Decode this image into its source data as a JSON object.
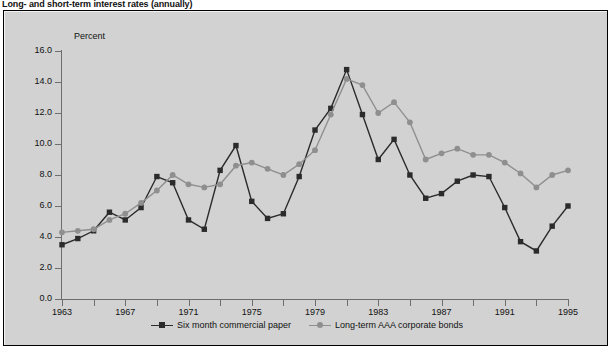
{
  "figure": {
    "title": "Long- and short-term interest rates (annually)",
    "background_color": "#d2d2d2",
    "page_color": "#ffffff",
    "border_color": "#000000"
  },
  "axes": {
    "y_unit_label": "Percent",
    "y_ticks": [
      "0.0",
      "2.0",
      "4.0",
      "6.0",
      "8.0",
      "10.0",
      "12.0",
      "14.0",
      "16.0"
    ],
    "y_min": 0.0,
    "y_max": 16.0,
    "x_ticks": [
      "1963",
      "1967",
      "1971",
      "1975",
      "1979",
      "1983",
      "1987",
      "1991",
      "1995"
    ],
    "x_min": 1963,
    "x_max": 1995,
    "axis_color": "#6e6e6e"
  },
  "legend": {
    "position": "bottom-center",
    "items": [
      {
        "label": "Six month commercial paper",
        "color": "#2b2b2b",
        "marker": "square"
      },
      {
        "label": "Long-term AAA corporate bonds",
        "color": "#8f8f8f",
        "marker": "circle"
      }
    ]
  },
  "chart_data": {
    "type": "line",
    "title": "Long- and short-term interest rates (annually)",
    "xlabel": "",
    "ylabel": "Percent",
    "ylim": [
      0.0,
      16.0
    ],
    "xlim": [
      1963,
      1995
    ],
    "grid": false,
    "legend_position": "bottom-center",
    "x": [
      1963,
      1964,
      1965,
      1966,
      1967,
      1968,
      1969,
      1970,
      1971,
      1972,
      1973,
      1974,
      1975,
      1976,
      1977,
      1978,
      1979,
      1980,
      1981,
      1982,
      1983,
      1984,
      1985,
      1986,
      1987,
      1988,
      1989,
      1990,
      1991,
      1992,
      1993,
      1994,
      1995
    ],
    "series": [
      {
        "name": "Six month commercial paper",
        "color": "#2b2b2b",
        "marker": "square",
        "values": [
          3.5,
          3.9,
          4.4,
          5.6,
          5.1,
          5.9,
          7.9,
          7.5,
          5.1,
          4.5,
          8.3,
          9.9,
          6.3,
          5.2,
          5.5,
          7.9,
          10.9,
          12.3,
          14.8,
          11.9,
          9.0,
          10.3,
          8.0,
          6.5,
          6.8,
          7.6,
          8.0,
          7.9,
          5.9,
          3.7,
          3.1,
          4.7,
          6.0
        ]
      },
      {
        "name": "Long-term AAA corporate bonds",
        "color": "#8f8f8f",
        "marker": "circle",
        "values": [
          4.3,
          4.4,
          4.5,
          5.1,
          5.5,
          6.2,
          7.0,
          8.0,
          7.4,
          7.2,
          7.4,
          8.6,
          8.8,
          8.4,
          8.0,
          8.7,
          9.6,
          11.9,
          14.2,
          13.8,
          12.0,
          12.7,
          11.4,
          9.0,
          9.4,
          9.7,
          9.3,
          9.3,
          8.8,
          8.1,
          7.2,
          8.0,
          8.3
        ]
      }
    ]
  }
}
